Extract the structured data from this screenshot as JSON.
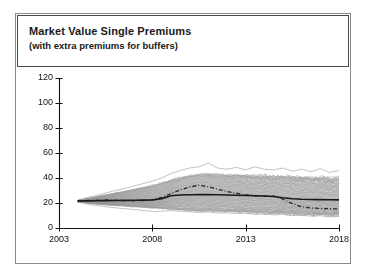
{
  "figure": {
    "title": "Market Value Single Premiums",
    "subtitle": "(with extra premiums for buffers)"
  },
  "colors": {
    "band_fill": "#cfcfcf",
    "band_path": "#9a9a9a",
    "median_line": "#1a1a1a",
    "dashed_line": "#2a2a2a",
    "axis": "#111111",
    "frame": "#8a8a8a",
    "title_border": "#4a4a4a",
    "background": "#ffffff"
  },
  "chart_data": {
    "type": "area",
    "title": "Market Value Single Premiums",
    "subtitle": "(with extra premiums for buffers)",
    "xlabel": "",
    "ylabel": "",
    "xlim": [
      2003,
      2018
    ],
    "ylim": [
      0,
      120
    ],
    "grid": false,
    "legend": false,
    "xticks": [
      2003,
      2008,
      2013,
      2018
    ],
    "xtick_labels": [
      "2003",
      "2008",
      "2013",
      "2018"
    ],
    "yticks": [
      0,
      20,
      40,
      60,
      80,
      100,
      120
    ],
    "ytick_labels": [
      "0",
      "20",
      "40",
      "60",
      "80",
      "100",
      "120"
    ],
    "x": [
      2004.0,
      2004.5,
      2005.0,
      2005.5,
      2006.0,
      2006.5,
      2007.0,
      2007.5,
      2008.0,
      2008.5,
      2009.0,
      2009.5,
      2010.0,
      2010.5,
      2011.0,
      2011.5,
      2012.0,
      2012.5,
      2013.0,
      2013.5,
      2014.0,
      2014.5,
      2015.0,
      2015.5,
      2016.0,
      2016.5,
      2017.0,
      2017.5,
      2018.0
    ],
    "series": [
      {
        "name": "envelope-upper",
        "style": "fill-boundary",
        "values": [
          22.0,
          23.5,
          25.0,
          26.5,
          28.0,
          29.5,
          31.0,
          32.5,
          34.0,
          36.0,
          38.5,
          40.5,
          42.0,
          43.0,
          43.5,
          43.0,
          42.5,
          42.5,
          42.5,
          42.0,
          42.0,
          41.5,
          41.5,
          41.0,
          41.0,
          40.5,
          40.5,
          40.0,
          40.0
        ]
      },
      {
        "name": "envelope-lower",
        "style": "fill-boundary",
        "values": [
          21.0,
          20.0,
          19.2,
          18.5,
          18.0,
          17.5,
          17.0,
          16.5,
          16.0,
          15.5,
          15.0,
          14.5,
          14.0,
          13.5,
          13.5,
          13.0,
          13.0,
          12.5,
          12.5,
          12.0,
          12.0,
          11.5,
          11.5,
          11.0,
          11.0,
          10.5,
          10.5,
          10.0,
          10.0
        ]
      },
      {
        "name": "scenario-max-outlier",
        "style": "thin-line",
        "values": [
          22.2,
          24.5,
          26.0,
          28.0,
          30.0,
          31.5,
          33.5,
          35.5,
          37.5,
          40.0,
          43.5,
          46.0,
          48.0,
          49.0,
          52.0,
          48.0,
          47.0,
          48.5,
          46.5,
          49.0,
          47.0,
          46.5,
          48.0,
          45.5,
          47.0,
          45.0,
          47.5,
          44.5,
          46.0
        ]
      },
      {
        "name": "scenario-min-outlier",
        "style": "thin-line",
        "values": [
          20.8,
          19.2,
          18.0,
          17.0,
          16.2,
          15.5,
          14.8,
          14.0,
          13.2,
          13.5,
          14.0,
          13.5,
          13.0,
          12.5,
          12.8,
          12.0,
          12.2,
          11.5,
          11.8,
          11.0,
          11.2,
          10.5,
          10.8,
          10.0,
          10.2,
          9.5,
          9.8,
          9.0,
          9.2
        ]
      },
      {
        "name": "median",
        "style": "solid-line",
        "values": [
          21.6,
          21.7,
          21.8,
          21.9,
          22.0,
          22.1,
          22.2,
          22.3,
          22.4,
          23.5,
          25.8,
          26.4,
          26.6,
          26.7,
          26.7,
          26.6,
          26.4,
          26.2,
          26.0,
          25.8,
          25.6,
          25.2,
          24.2,
          23.4,
          23.0,
          22.8,
          22.7,
          22.6,
          22.5
        ]
      },
      {
        "name": "deterministic",
        "style": "dash-dot-line",
        "values": [
          21.6,
          22.0,
          22.3,
          22.4,
          22.2,
          21.9,
          21.8,
          22.0,
          22.6,
          24.5,
          27.5,
          30.5,
          32.8,
          34.2,
          33.0,
          31.0,
          29.2,
          27.8,
          26.6,
          25.8,
          25.4,
          25.6,
          23.0,
          19.5,
          17.0,
          16.0,
          15.6,
          15.4,
          15.3
        ]
      }
    ]
  }
}
